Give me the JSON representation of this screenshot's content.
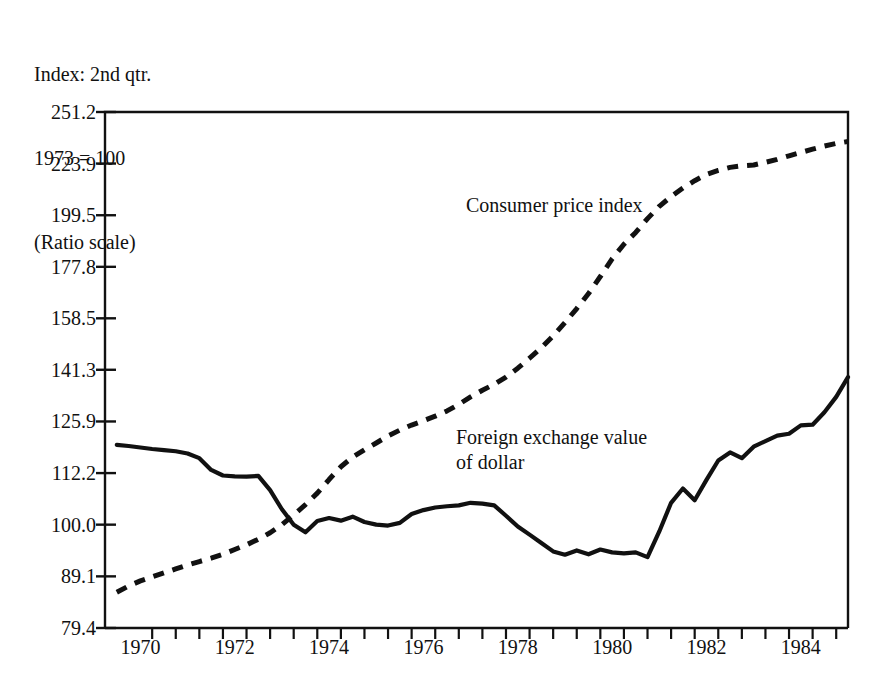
{
  "header": {
    "line1": "Index: 2nd qtr.",
    "line2": "1973 = 100",
    "line3": "(Ratio scale)"
  },
  "chart_data": {
    "type": "line",
    "title": "Index: 2nd qtr. 1973 = 100 (Ratio scale)",
    "xlabel": "",
    "ylabel": "",
    "scale": "log",
    "grid": false,
    "legend_position": "inline-annotation",
    "xlim": [
      1969.5,
      1985.25
    ],
    "ylim": [
      79.4,
      251.2
    ],
    "ytick_labels": [
      "251.2",
      "223.9",
      "199.5",
      "177.8",
      "158.5",
      "141.3",
      "125.9",
      "112.2",
      "100.0",
      "89.1",
      "79.4"
    ],
    "ytick_values": [
      251.2,
      223.9,
      199.5,
      177.8,
      158.5,
      141.3,
      125.9,
      112.2,
      100.0,
      89.1,
      79.4
    ],
    "xtick_labels": [
      "1970",
      "1972",
      "1974",
      "1976",
      "1978",
      "1980",
      "1982",
      "1984"
    ],
    "xtick_values": [
      1970,
      1972,
      1974,
      1976,
      1978,
      1980,
      1982,
      1984
    ],
    "xminor_ticks": [
      1970.5,
      1971,
      1971.5,
      1972,
      1972.5,
      1973,
      1973.5,
      1974,
      1974.5,
      1975,
      1975.5,
      1976,
      1976.5,
      1977,
      1977.5,
      1978,
      1978.5,
      1979,
      1979.5,
      1980,
      1980.5,
      1981,
      1981.5,
      1982,
      1982.5,
      1983,
      1983.5,
      1984,
      1984.5,
      1985
    ],
    "series": [
      {
        "name": "Consumer price index",
        "style": "dashed",
        "color": "#111111",
        "label_position": {
          "x": 466,
          "y": 193
        },
        "x": [
          1969.75,
          1970.0,
          1970.25,
          1970.5,
          1970.75,
          1971.0,
          1971.25,
          1971.5,
          1971.75,
          1972.0,
          1972.25,
          1972.5,
          1972.75,
          1973.0,
          1973.25,
          1973.5,
          1973.75,
          1974.0,
          1974.25,
          1974.5,
          1974.75,
          1975.0,
          1975.25,
          1975.5,
          1975.75,
          1976.0,
          1976.25,
          1976.5,
          1976.75,
          1977.0,
          1977.25,
          1977.5,
          1977.75,
          1978.0,
          1978.25,
          1978.5,
          1978.75,
          1979.0,
          1979.25,
          1979.5,
          1979.75,
          1980.0,
          1980.25,
          1980.5,
          1980.75,
          1981.0,
          1981.25,
          1981.5,
          1981.75,
          1982.0,
          1982.25,
          1982.5,
          1982.75,
          1983.0,
          1983.25,
          1983.5,
          1983.75,
          1984.0,
          1984.25,
          1984.5,
          1984.75,
          1985.0,
          1985.25
        ],
        "y": [
          86.0,
          87.2,
          88.2,
          89.0,
          89.8,
          90.6,
          91.4,
          92.1,
          92.8,
          93.6,
          94.6,
          95.6,
          96.8,
          98.2,
          100.0,
          102.2,
          104.6,
          107.3,
          110.6,
          113.8,
          116.3,
          118.2,
          120.0,
          121.9,
          123.5,
          124.9,
          126.1,
          127.4,
          128.9,
          130.8,
          133.0,
          135.0,
          136.8,
          139.0,
          141.8,
          145.0,
          148.4,
          152.4,
          157.0,
          162.0,
          167.5,
          174.0,
          181.0,
          187.0,
          192.0,
          198.0,
          203.5,
          208.0,
          212.0,
          215.5,
          218.5,
          220.5,
          222.0,
          222.8,
          223.2,
          224.5,
          226.0,
          227.8,
          229.5,
          231.2,
          232.8,
          234.2,
          235.2
        ]
      },
      {
        "name": "Foreign exchange value of dollar",
        "style": "solid",
        "color": "#111111",
        "label_position": {
          "x": 456,
          "y": 425
        },
        "x": [
          1969.75,
          1970.0,
          1970.25,
          1970.5,
          1970.75,
          1971.0,
          1971.25,
          1971.5,
          1971.75,
          1972.0,
          1972.25,
          1972.5,
          1972.75,
          1973.0,
          1973.25,
          1973.5,
          1973.75,
          1974.0,
          1974.25,
          1974.5,
          1974.75,
          1975.0,
          1975.25,
          1975.5,
          1975.75,
          1976.0,
          1976.25,
          1976.5,
          1976.75,
          1977.0,
          1977.25,
          1977.5,
          1977.75,
          1978.0,
          1978.25,
          1978.5,
          1978.75,
          1979.0,
          1979.25,
          1979.5,
          1979.75,
          1980.0,
          1980.25,
          1980.5,
          1980.75,
          1981.0,
          1981.25,
          1981.5,
          1981.75,
          1982.0,
          1982.25,
          1982.5,
          1982.75,
          1983.0,
          1983.25,
          1983.5,
          1983.75,
          1984.0,
          1984.25,
          1984.5,
          1984.75,
          1985.0,
          1985.25
        ],
        "y": [
          119.5,
          119.2,
          118.8,
          118.4,
          118.1,
          117.8,
          117.2,
          116.0,
          113.0,
          111.6,
          111.4,
          111.3,
          111.5,
          108.0,
          103.5,
          100.0,
          98.3,
          100.8,
          101.5,
          100.9,
          101.8,
          100.6,
          100.0,
          99.8,
          100.4,
          102.4,
          103.3,
          103.9,
          104.2,
          104.4,
          105.0,
          104.8,
          104.4,
          102.0,
          99.6,
          97.8,
          96.0,
          94.2,
          93.5,
          94.4,
          93.6,
          94.6,
          94.0,
          93.8,
          94.0,
          93.0,
          98.5,
          105.0,
          108.4,
          105.6,
          110.5,
          115.4,
          117.5,
          116.0,
          119.0,
          120.5,
          122.0,
          122.5,
          124.8,
          125.0,
          128.5,
          133.0,
          139.0
        ]
      }
    ]
  }
}
